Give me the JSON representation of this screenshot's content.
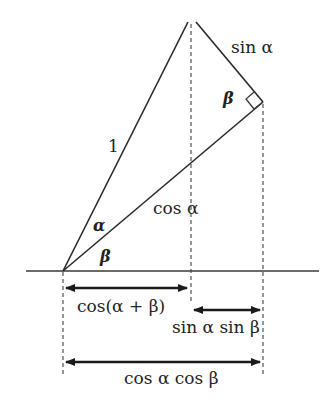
{
  "diagram": {
    "labels": {
      "hypotenuse": "1",
      "opposite": "sin α",
      "adjacent": "cos α",
      "angle_alpha": "α",
      "angle_beta_origin": "β",
      "angle_beta_top": "β",
      "measure_cos_sum": "cos(α + β)",
      "measure_sin_sin": "sin α sin β",
      "measure_cos_cos": "cos α cos β"
    },
    "colors": {
      "ink": "#222222",
      "background": "#ffffff"
    }
  }
}
